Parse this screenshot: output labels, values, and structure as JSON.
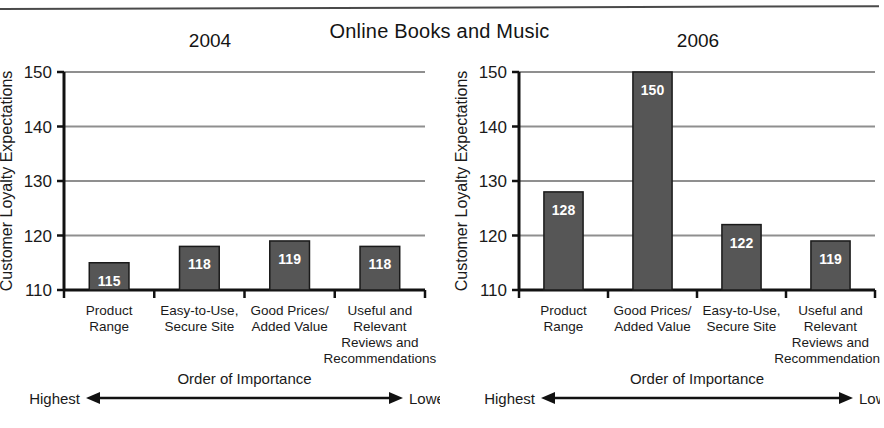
{
  "figure": {
    "title": "Online Books and Music",
    "top_rule": true
  },
  "axis": {
    "y_label": "Customer Loyalty Expectations",
    "y_ticks": [
      110,
      120,
      130,
      140,
      150
    ],
    "y_min": 110,
    "y_max": 150,
    "x_axis_caption": "Order of Importance",
    "x_axis_left_end": "Highest",
    "x_axis_right_end": "Lowest"
  },
  "colors": {
    "bar_fill": "#565656",
    "bar_stroke": "#1a1a1a",
    "gridline": "#8f8f8f",
    "axis": "#111111",
    "value_text": "#ffffff",
    "background": "#ffffff"
  },
  "chart_data": [
    {
      "type": "bar",
      "title": "2004",
      "xlabel": "Order of Importance",
      "ylabel": "Customer Loyalty Expectations",
      "ylim": [
        110,
        150
      ],
      "yticks": [
        110,
        120,
        130,
        140,
        150
      ],
      "grid": true,
      "legend": "none",
      "categories": [
        "Product Range",
        "Easy-to-Use, Secure Site",
        "Good Prices/ Added Value",
        "Useful and Relevant Reviews and Recommendations"
      ],
      "category_lines": [
        [
          "Product",
          "Range"
        ],
        [
          "Easy-to-Use,",
          "Secure Site"
        ],
        [
          "Good Prices/",
          "Added Value"
        ],
        [
          "Useful and",
          "Relevant",
          "Reviews and",
          "Recommendations"
        ]
      ],
      "values": [
        115,
        118,
        119,
        118
      ],
      "data_labels": [
        "115",
        "118",
        "119",
        "118"
      ]
    },
    {
      "type": "bar",
      "title": "2006",
      "xlabel": "Order of Importance",
      "ylabel": "Customer Loyalty Expectations",
      "ylim": [
        110,
        150
      ],
      "yticks": [
        110,
        120,
        130,
        140,
        150
      ],
      "grid": true,
      "legend": "none",
      "categories": [
        "Product Range",
        "Good Prices/ Added Value",
        "Easy-to-Use, Secure Site",
        "Useful and Relevant Reviews and Recommendations"
      ],
      "category_lines": [
        [
          "Product",
          "Range"
        ],
        [
          "Good Prices/",
          "Added Value"
        ],
        [
          "Easy-to-Use,",
          "Secure Site"
        ],
        [
          "Useful and",
          "Relevant",
          "Reviews and",
          "Recommendations"
        ]
      ],
      "values": [
        128,
        150,
        122,
        119
      ],
      "data_labels": [
        "128",
        "150",
        "122",
        "119"
      ]
    }
  ]
}
